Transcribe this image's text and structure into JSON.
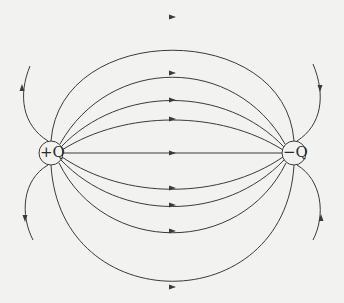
{
  "diagram": {
    "charges": [
      {
        "label": "+Q",
        "cx": 51,
        "cy": 153,
        "r": 12
      },
      {
        "label": "−Q",
        "cx": 294,
        "cy": 153,
        "r": 12
      }
    ],
    "colors": {
      "line": "#3a3a3a",
      "background": "#f2f2f0"
    },
    "field_lines": [
      {
        "name": "top-outer",
        "d": "M51,141 C60,20 285,20 294,141",
        "arrow": [
          172,
          17
        ]
      },
      {
        "name": "top-3",
        "d": "M60,144 C110,55 235,55 285,144",
        "arrow": [
          172,
          73
        ]
      },
      {
        "name": "top-2",
        "d": "M61,147 C120,85 225,85 284,147",
        "arrow": [
          172,
          100
        ]
      },
      {
        "name": "top-1",
        "d": "M62,150 C125,110 220,110 283,150",
        "arrow": [
          172,
          119
        ]
      },
      {
        "name": "axis",
        "d": "M63,153 L282,153",
        "arrow": [
          172,
          153
        ]
      },
      {
        "name": "bottom-1",
        "d": "M62,157 C125,200 220,200 283,157",
        "arrow": [
          172,
          188
        ]
      },
      {
        "name": "bottom-2",
        "d": "M61,160 C120,222 225,222 284,160",
        "arrow": [
          172,
          205
        ]
      },
      {
        "name": "bottom-3",
        "d": "M59,163 C105,256 240,256 286,163",
        "arrow": [
          172,
          231
        ]
      },
      {
        "name": "bottom-outer",
        "d": "M51,165 C60,320 285,320 294,165",
        "arrow": [
          172,
          287
        ]
      },
      {
        "name": "left-up",
        "d": "M48,141 C22,125 18,95 30,66",
        "arrow": [
          22,
          88
        ],
        "dir": "up"
      },
      {
        "name": "left-down",
        "d": "M48,165 C22,180 20,215 33,240",
        "arrow": [
          25,
          218
        ],
        "dir": "down"
      },
      {
        "name": "right-up",
        "d": "M297,165 C322,180 326,215 313,240",
        "arrow": [
          321,
          218
        ],
        "dir": "up"
      },
      {
        "name": "right-down",
        "d": "M297,141 C322,125 326,95 313,64",
        "arrow": [
          320,
          88
        ],
        "dir": "down"
      }
    ]
  }
}
